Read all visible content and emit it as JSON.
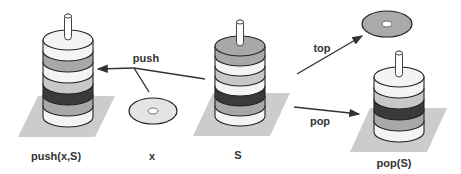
{
  "diagram": {
    "colors": {
      "platform": "#cccccc",
      "disk_white": "#f4f4f4",
      "disk_light": "#c8c8c8",
      "disk_mid": "#a8a8a8",
      "disk_dark": "#3a3a3a",
      "outline": "#222222",
      "arrow": "#333333"
    },
    "labels": {
      "push_result": "push(x,S)",
      "element": "x",
      "stack": "S",
      "pop_result": "pop(S)",
      "push_arrow": "push",
      "top_arrow": "top",
      "pop_arrow": "pop"
    },
    "stacks": {
      "push_result": [
        "white",
        "mid",
        "white",
        "light",
        "dark",
        "mid",
        "white"
      ],
      "stack": [
        "mid",
        "white",
        "light",
        "white",
        "dark",
        "mid",
        "white"
      ],
      "pop_result": [
        "white",
        "light",
        "dark",
        "mid",
        "white"
      ]
    }
  }
}
